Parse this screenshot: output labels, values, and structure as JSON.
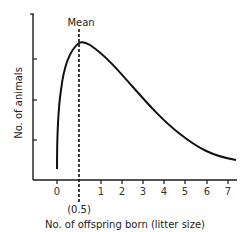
{
  "chart_data": {
    "type": "line",
    "title": "",
    "xlabel": "No. of offspring born (litter size)",
    "ylabel": "No. of animals",
    "x_ticks": [
      "0",
      "1",
      "2",
      "3",
      "4",
      "5",
      "6",
      "7"
    ],
    "y_ticks": [],
    "annotations": [
      {
        "text": "Mean",
        "x": 0.5,
        "style": "dashed vertical line"
      },
      {
        "text": "(0.5)",
        "x": 0.5,
        "position": "below axis"
      }
    ],
    "series": [
      {
        "name": "distribution",
        "description": "right-skewed curve peaking at the mean (0.5) and tailing off toward 7",
        "x": [
          0,
          0.1,
          0.25,
          0.5,
          1,
          2,
          3,
          4,
          5,
          6,
          7
        ],
        "y_relative": [
          0.08,
          0.55,
          0.85,
          1.0,
          0.9,
          0.62,
          0.4,
          0.25,
          0.13,
          0.06,
          0.05
        ]
      }
    ],
    "grid": false,
    "legend": null
  },
  "labels": {
    "mean": "Mean",
    "mean_value": "(0.5)",
    "xlabel": "No. of offspring born (litter size)",
    "ylabel": "No. of animals"
  },
  "ticks": [
    {
      "label": "0",
      "px": 57
    },
    {
      "label": "1",
      "px": 101
    },
    {
      "label": "2",
      "px": 122
    },
    {
      "label": "3",
      "px": 143
    },
    {
      "label": "4",
      "px": 164
    },
    {
      "label": "5",
      "px": 185
    },
    {
      "label": "6",
      "px": 207
    },
    {
      "label": "7",
      "px": 228
    }
  ]
}
